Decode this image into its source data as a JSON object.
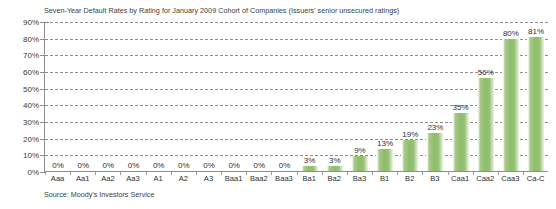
{
  "chart_data": {
    "type": "bar",
    "title": "Seven-Year Default Rates by Rating for January 2009 Cohort of Companies (Issuers' senior unsecured ratings)",
    "xlabel": "",
    "ylabel": "",
    "ylim": [
      0,
      90
    ],
    "ytick_step": 10,
    "ytick_labels": [
      "90%",
      "80%",
      "70%",
      "60%",
      "50%",
      "40%",
      "30%",
      "20%",
      "10%",
      "0%"
    ],
    "ytick_values": [
      90,
      80,
      70,
      60,
      50,
      40,
      30,
      20,
      10,
      0
    ],
    "grid": true,
    "grid_style": "dashed-horizontal",
    "legend": false,
    "bar_color": "#8fbd6a",
    "categories": [
      "Aaa",
      "Aa1",
      "Aa2",
      "Aa3",
      "A1",
      "A2",
      "A3",
      "Baa1",
      "Baa2",
      "Baa3",
      "Ba1",
      "Ba2",
      "Ba3",
      "B1",
      "B2",
      "B3",
      "Caa1",
      "Caa2",
      "Caa3",
      "Ca-C"
    ],
    "values": [
      0,
      0,
      0,
      0,
      0,
      0,
      0,
      0,
      0,
      0,
      3,
      3,
      9,
      13,
      19,
      23,
      35,
      56,
      80,
      81
    ],
    "data_labels": [
      "0%",
      "0%",
      "0%",
      "0%",
      "0%",
      "0%",
      "0%",
      "0%",
      "0%",
      "0%",
      "3%",
      "3%",
      "9%",
      "13%",
      "19%",
      "23%",
      "35%",
      "56%",
      "80%",
      "81%"
    ],
    "source": "Source: Moody's Investors Service"
  }
}
